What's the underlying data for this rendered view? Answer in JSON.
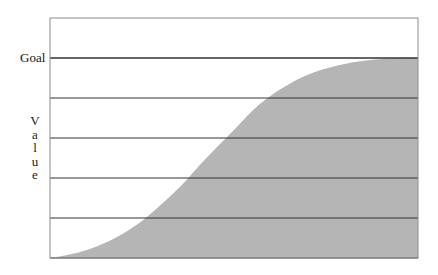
{
  "chart_data": {
    "type": "area",
    "title": "",
    "xlabel": "",
    "ylabel": "Value",
    "goal_label": "Goal",
    "goal_value": 5,
    "ylim": [
      0,
      6
    ],
    "xlim": [
      0,
      1
    ],
    "grid": true,
    "gridlines_y": [
      1,
      2,
      3,
      4,
      5
    ],
    "legend": null,
    "fill_color": "#b5b5b5",
    "gridline_color": "#333333",
    "x": [
      0,
      0.05,
      0.1,
      0.15,
      0.2,
      0.26,
      0.35,
      0.42,
      0.5,
      0.57,
      0.65,
      0.72,
      0.8,
      0.86,
      0.93,
      1.0
    ],
    "values": [
      0,
      0.08,
      0.2,
      0.38,
      0.62,
      1.0,
      1.75,
      2.45,
      3.2,
      3.85,
      4.35,
      4.65,
      4.85,
      4.94,
      4.99,
      5.0
    ]
  }
}
